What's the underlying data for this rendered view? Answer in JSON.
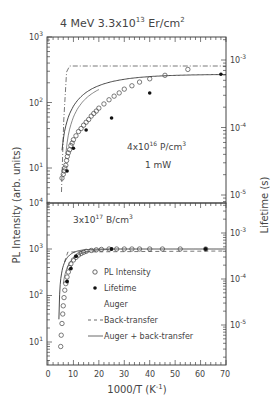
{
  "chart_data": [
    {
      "type": "scatter",
      "panel": "top",
      "title": "4 MeV 3.3x10^13 Er/cm^2",
      "annotations": [
        "4x10^16 P/cm^3",
        "1 mW"
      ],
      "xlabel": "1000/T (K^-1)",
      "ylabel": "PL Intensity (arb. units)",
      "ylabel_right": "Lifetime (s)",
      "xlim": [
        0,
        70
      ],
      "ylim": [
        10000,
        1000
      ],
      "yticks_left": [
        "10^3",
        "10^2",
        "10^1",
        "10^4"
      ],
      "yticks_right": [
        "10^-3",
        "10^-4",
        "10^-5"
      ],
      "series": [
        {
          "name": "PL Intensity",
          "marker": "open-circle",
          "x": [
            5.5,
            6,
            6.3,
            6.6,
            7,
            7.3,
            7.6,
            8,
            8.5,
            9,
            9.5,
            10,
            11,
            12,
            13,
            14,
            15,
            16,
            17,
            18,
            19,
            20,
            22,
            24,
            26,
            28,
            30,
            33,
            36,
            40,
            46,
            55
          ],
          "y": [
            7,
            8,
            9,
            10,
            11,
            13,
            15,
            17,
            19,
            22,
            24,
            27,
            31,
            36,
            40,
            45,
            50,
            55,
            62,
            68,
            74,
            82,
            95,
            110,
            125,
            140,
            160,
            180,
            205,
            230,
            260,
            320
          ]
        },
        {
          "name": "Lifetime",
          "marker": "filled-circle",
          "x": [
            7.5,
            10,
            15,
            25,
            40,
            68
          ],
          "y": [
            9,
            20,
            38,
            58,
            140,
            270
          ]
        },
        {
          "name": "Back-transfer",
          "style": "dash-dot"
        },
        {
          "name": "Auger + back-transfer",
          "style": "solid"
        }
      ]
    },
    {
      "type": "scatter",
      "panel": "bottom",
      "annotations": [
        "3x10^17 B/cm^3"
      ],
      "xlabel": "1000/T (K^-1)",
      "xticks": [
        "0",
        "10",
        "20",
        "30",
        "40",
        "50",
        "60",
        "70"
      ],
      "xlim": [
        0,
        70
      ],
      "yticks_left": [
        "10^4",
        "10^3",
        "10^2",
        "10^1"
      ],
      "yticks_right": [
        "10^-3",
        "10^-4",
        "10^-5"
      ],
      "series": [
        {
          "name": "PL Intensity",
          "marker": "open-circle",
          "x": [
            5,
            5.2,
            5.5,
            5.8,
            6,
            6.3,
            6.6,
            7,
            7.5,
            8,
            8.5,
            9,
            10,
            11,
            12,
            13,
            14,
            15,
            17,
            19,
            21,
            24,
            27,
            30,
            33,
            36,
            40,
            45,
            52,
            62
          ],
          "y": [
            8,
            14,
            25,
            40,
            60,
            90,
            130,
            180,
            250,
            320,
            400,
            480,
            580,
            660,
            740,
            800,
            850,
            890,
            930,
            960,
            980,
            1000,
            1000,
            1000,
            1000,
            1000,
            1000,
            1000,
            1000,
            1000
          ]
        },
        {
          "name": "Lifetime",
          "marker": "filled-circle",
          "x": [
            7.5,
            9,
            11,
            25,
            62
          ],
          "y": [
            200,
            380,
            700,
            1000,
            1000
          ]
        }
      ],
      "legend": [
        "PL Intensity",
        "Lifetime",
        "Auger",
        "Back-transfer",
        "Auger + back-transfer"
      ]
    }
  ],
  "labels": {
    "title_prefix": "4 MeV 3.3x10",
    "title_exp": "13",
    "title_suffix": " Er/cm",
    "title_sup2": "2",
    "top_ann1_a": "4x10",
    "top_ann1_exp": "16",
    "top_ann1_b": " P/cm",
    "top_ann1_sup": "3",
    "top_ann2": "1 mW",
    "bot_ann_a": "3x10",
    "bot_ann_exp": "17",
    "bot_ann_b": " B/cm",
    "bot_ann_sup": "3",
    "ylabel": "PL Intensity (arb. units)",
    "ylabel_right": "Lifetime (s)",
    "xlabel_a": "1000/T (K",
    "xlabel_exp": "-1",
    "xlabel_b": ")",
    "legend_pl": "PL Intensity",
    "legend_lifetime": "Lifetime",
    "legend_auger": "Auger",
    "legend_back": "Back-transfer",
    "legend_both": "Auger + back-transfer",
    "ten": "10",
    "e3": "3",
    "e2": "2",
    "e1": "1",
    "e4": "4",
    "em3": "-3",
    "em4": "-4",
    "em5": "-5",
    "x0": "0",
    "x10": "10",
    "x20": "20",
    "x30": "30",
    "x40": "40",
    "x50": "50",
    "x60": "60",
    "x70": "70"
  }
}
